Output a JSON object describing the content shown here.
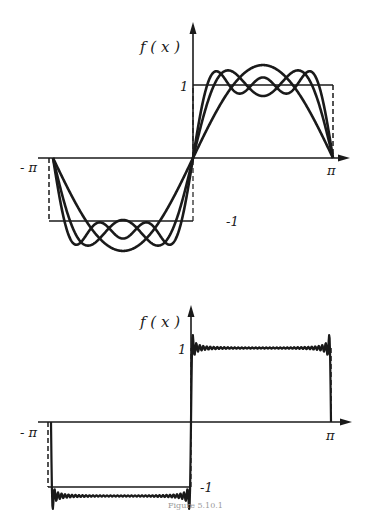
{
  "chart_data": [
    {
      "type": "line",
      "title": "Fourier partial sums of a square wave (low order)",
      "ylabel": "f ( x )",
      "xlabel": "",
      "x_ticks": [
        "-π",
        "π"
      ],
      "y_ticks": [
        "1",
        "-1"
      ],
      "xlim": [
        -3.1416,
        3.1416
      ],
      "ylim": [
        -1.3,
        1.3
      ],
      "series": [
        {
          "name": "square wave",
          "style": "solid with dashed verticals",
          "description": "f(x) = -1 on (-π,0), +1 on (0,π)"
        },
        {
          "name": "partial sum N=1",
          "terms": [
            1
          ]
        },
        {
          "name": "partial sum N=3",
          "terms": [
            1,
            3
          ]
        },
        {
          "name": "partial sum N=5",
          "terms": [
            1,
            3,
            5
          ]
        }
      ],
      "grid": false,
      "legend": "none"
    },
    {
      "type": "line",
      "title": "Fourier partial sum of a square wave (high order)",
      "ylabel": "f ( x )",
      "xlabel": "",
      "x_ticks": [
        "-π",
        "π"
      ],
      "y_ticks": [
        "1",
        "-1"
      ],
      "xlim": [
        -3.1416,
        3.1416
      ],
      "ylim": [
        -1.3,
        1.3
      ],
      "series": [
        {
          "name": "square wave",
          "style": "dashed verticals"
        },
        {
          "name": "partial sum (many terms)",
          "description": "near-square with Gibbs overshoot at discontinuities"
        }
      ],
      "grid": false,
      "legend": "none"
    }
  ],
  "labels": {
    "top": {
      "fx": "f ( x )",
      "one": "1",
      "neg_one": "-1",
      "neg_pi": "- π",
      "pi": "π"
    },
    "bottom": {
      "fx": "f ( x )",
      "one": "1",
      "neg_one": "-1",
      "neg_pi": "- π",
      "pi": "π"
    },
    "caption": "Figure 5.10.1"
  }
}
